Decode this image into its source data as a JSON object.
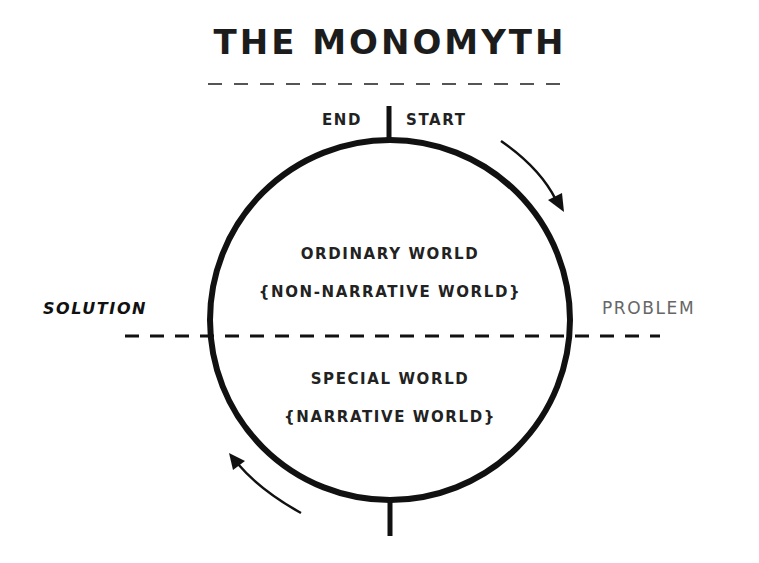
{
  "title": "THE MONOMYTH",
  "markers": {
    "end": "END",
    "start": "START"
  },
  "upper_half": {
    "line1": "ORDINARY WORLD",
    "line2": "{NON-NARRATIVE WORLD}"
  },
  "lower_half": {
    "line1": "SPECIAL WORLD",
    "line2": "{NARRATIVE WORLD}"
  },
  "side_labels": {
    "left": "SOLUTION",
    "right": "PROBLEM"
  },
  "arrows": {
    "top_right": "clockwise-arrow-down",
    "bottom_left": "clockwise-arrow-up"
  },
  "colors": {
    "ink": "#1a1a1a",
    "problem_text": "#666666",
    "background": "#ffffff"
  }
}
